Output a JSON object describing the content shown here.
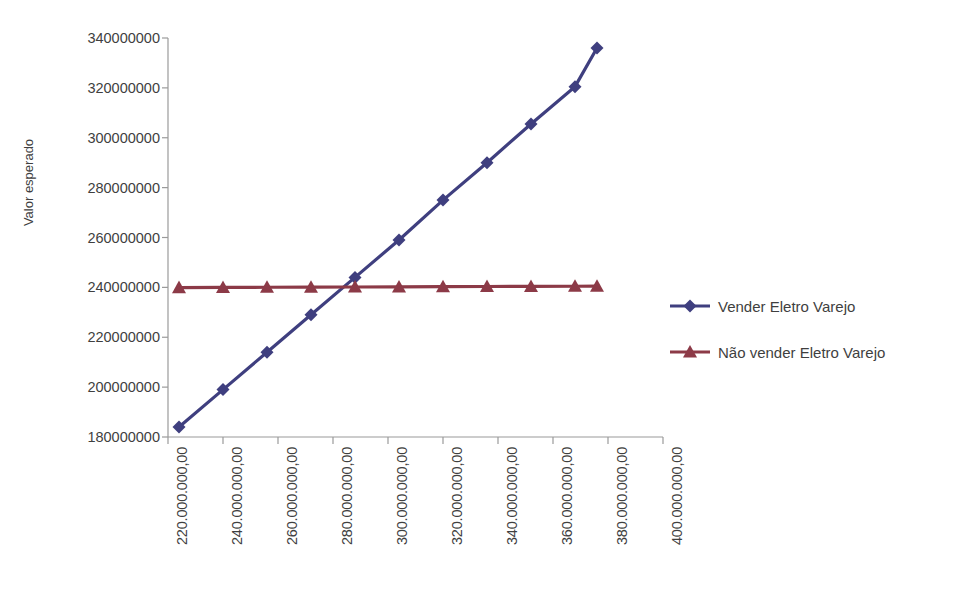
{
  "chart": {
    "title": "",
    "y_axis_title": "Valor esperado"
  },
  "legend": {
    "items": [
      {
        "label": "Vender Eletro Varejo",
        "color": "#3f3f7f",
        "marker": "diamond-marker"
      },
      {
        "label": "Não vender Eletro Varejo",
        "color": "#8c3a47",
        "marker": "triangle-marker"
      }
    ]
  },
  "chart_data": {
    "type": "line",
    "title": "",
    "xlabel": "",
    "ylabel": "Valor esperado",
    "grid": false,
    "legend_position": "right",
    "xlim": [
      220000000,
      400000000
    ],
    "ylim": [
      180000000,
      340000000
    ],
    "x_tick_labels": [
      "220.000.000,00",
      "240.000.000,00",
      "260.000.000,00",
      "280.000.000,00",
      "300.000.000,00",
      "320.000.000,00",
      "340.000.000,00",
      "360.000.000,00",
      "380.000.000,00",
      "400.000.000,00"
    ],
    "x_ticks": [
      220000000,
      240000000,
      260000000,
      280000000,
      300000000,
      320000000,
      340000000,
      360000000,
      380000000,
      400000000
    ],
    "y_tick_labels": [
      "340000000",
      "320000000",
      "300000000",
      "280000000",
      "260000000",
      "240000000",
      "220000000",
      "200000000",
      "180000000"
    ],
    "y_ticks": [
      340000000,
      320000000,
      300000000,
      280000000,
      260000000,
      240000000,
      220000000,
      200000000,
      180000000
    ],
    "x": [
      224000000,
      240000000,
      256000000,
      272000000,
      288000000,
      304000000,
      320000000,
      336000000,
      352000000,
      368000000,
      376000000
    ],
    "series": [
      {
        "name": "Vender Eletro Varejo",
        "color": "#3f3f7f",
        "marker": "diamond",
        "values": [
          184000000,
          199000000,
          214000000,
          229000000,
          244000000,
          259000000,
          275000000,
          290000000,
          305500000,
          320500000,
          336000000
        ]
      },
      {
        "name": "Não vender Eletro Varejo",
        "color": "#8c3a47",
        "marker": "triangle",
        "values": [
          239900000,
          240000000,
          240050000,
          240100000,
          240150000,
          240200000,
          240300000,
          240350000,
          240400000,
          240450000,
          240500000
        ]
      }
    ]
  }
}
